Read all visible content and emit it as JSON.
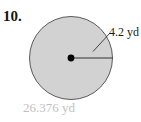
{
  "problem": {
    "number": "10.",
    "figure": {
      "shape_name": "circle",
      "fill_color": "#d2d2d2",
      "stroke_color": "#555555",
      "center_dot_color": "#000000",
      "radius_line_color": "#333333",
      "leader_line_color": "#333333",
      "center": {
        "x": 71,
        "y": 58
      },
      "radius_px": 42
    },
    "radius_label": "4.2 yd",
    "answer_label": "26.376 yd",
    "answer_color": "#bfbfbf"
  }
}
